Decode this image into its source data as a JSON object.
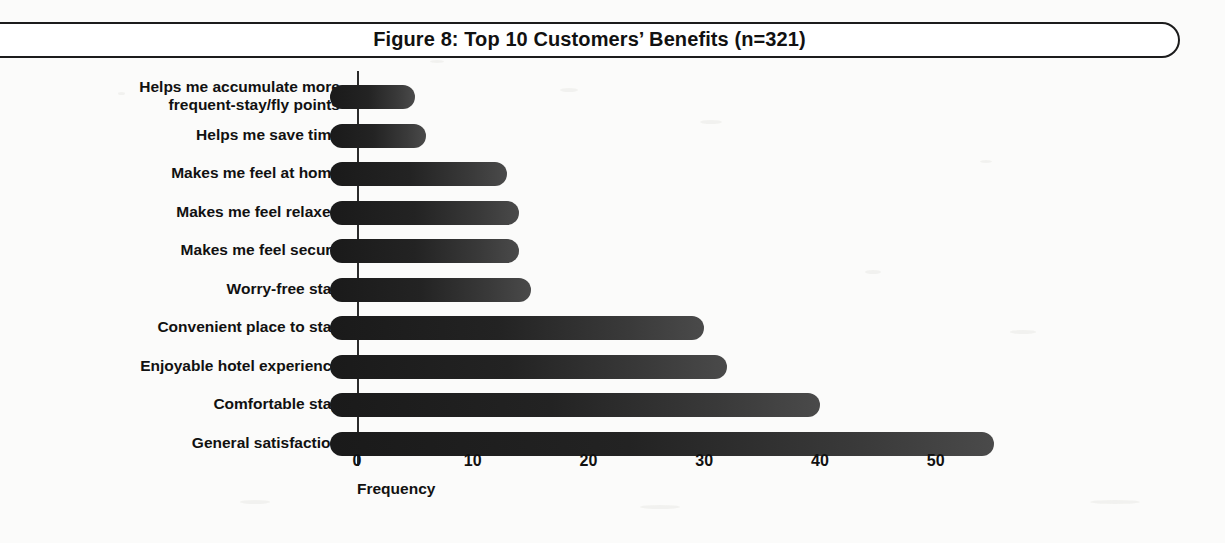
{
  "figure": {
    "title": "Figure 8: Top 10 Customers’ Benefits (n=321)",
    "banner_border_color": "#1c1c1c",
    "bar_color": "#1f1f1f",
    "axis_color": "#2b2b2b",
    "background_color": "#fbfbfa"
  },
  "chart_data": {
    "type": "bar",
    "orientation": "horizontal",
    "title": "Figure 8: Top 10 Customers’ Benefits (n=321)",
    "xlabel": "Frequency",
    "ylabel": "",
    "xlim": [
      0,
      57
    ],
    "xticks": [
      0,
      10,
      20,
      30,
      40,
      50
    ],
    "xticklabels": [
      "0",
      "10",
      "20",
      "30",
      "40",
      "50"
    ],
    "grid": false,
    "legend": null,
    "sample_size": 321,
    "categories": [
      "Helps me accumulate more frequent-stay/fly points",
      "Helps me save time",
      "Makes me feel at home",
      "Makes me feel relaxed",
      "Makes me feel secure",
      "Worry-free stay",
      "Convenient place to stay",
      "Enjoyable hotel experience",
      "Comfortable stay",
      "General satisfaction"
    ],
    "category_labels_wrapped": [
      [
        "Helps me accumulate more",
        "frequent-stay/fly points"
      ],
      [
        "Helps me save time"
      ],
      [
        "Makes me feel at home"
      ],
      [
        "Makes me feel relaxed"
      ],
      [
        "Makes me feel secure"
      ],
      [
        "Worry-free stay"
      ],
      [
        "Convenient place to stay"
      ],
      [
        "Enjoyable hotel experience"
      ],
      [
        "Comfortable stay"
      ],
      [
        "General satisfaction"
      ]
    ],
    "values": [
      5,
      6,
      13,
      14,
      14,
      15,
      30,
      32,
      40,
      55
    ]
  }
}
